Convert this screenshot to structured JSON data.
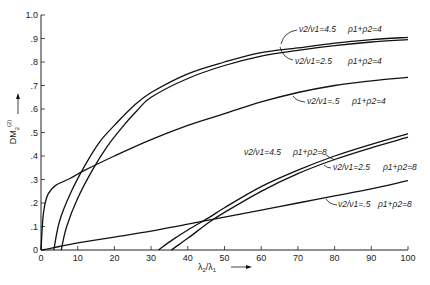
{
  "chart_data": {
    "type": "line",
    "title": "",
    "xlabel": "λ2/λ1 →",
    "ylabel": "DM2(2) →",
    "xlim": [
      0,
      100
    ],
    "ylim": [
      0,
      10
    ],
    "grid": false,
    "legend": "inline annotations",
    "x_ticks": [
      "0",
      "10",
      "20",
      "30",
      "40",
      "50",
      "60",
      "70",
      "80",
      "90",
      "100"
    ],
    "y_ticks": [
      "0",
      ".1",
      ".2",
      ".3",
      ".4",
      ".5",
      ".6",
      ".7",
      ".8",
      ".9",
      "1.0"
    ],
    "series": [
      {
        "name": "ν2/ν1=4.5, ρ1+ρ2=4",
        "x": [
          3.5,
          5,
          8,
          12,
          16,
          20,
          25,
          30,
          40,
          50,
          60,
          70,
          80,
          90,
          100
        ],
        "y": [
          0,
          1.2,
          2.4,
          3.6,
          4.6,
          5.3,
          6.1,
          6.7,
          7.5,
          8.0,
          8.4,
          8.6,
          8.8,
          8.95,
          9.05
        ]
      },
      {
        "name": "ν2/ν1=2.5, ρ1+ρ2=4",
        "x": [
          5.5,
          7,
          10,
          14,
          18,
          22,
          26,
          30,
          40,
          50,
          60,
          70,
          80,
          90,
          100
        ],
        "y": [
          0,
          1.0,
          2.2,
          3.4,
          4.4,
          5.2,
          5.9,
          6.5,
          7.3,
          7.85,
          8.25,
          8.5,
          8.7,
          8.85,
          8.95
        ]
      },
      {
        "name": "ν2/ν1=.5, ρ1+ρ2=4",
        "x": [
          0,
          0.5,
          1,
          2,
          4,
          8,
          12,
          20,
          30,
          40,
          50,
          60,
          70,
          80,
          90,
          100
        ],
        "y": [
          0,
          1.3,
          1.9,
          2.4,
          2.75,
          3.05,
          3.4,
          4.0,
          4.7,
          5.3,
          5.8,
          6.3,
          6.7,
          7.0,
          7.2,
          7.35
        ]
      },
      {
        "name": "ν2/ν1=4.5, ρ1+ρ2=8",
        "x": [
          32,
          36,
          40,
          46,
          50,
          60,
          70,
          80,
          90,
          100
        ],
        "y": [
          0,
          0.45,
          0.85,
          1.4,
          1.8,
          2.7,
          3.4,
          4.0,
          4.5,
          4.95
        ]
      },
      {
        "name": "ν2/ν1=2.5, ρ1+ρ2=8",
        "x": [
          35.5,
          40,
          46,
          50,
          60,
          70,
          80,
          90,
          100
        ],
        "y": [
          0,
          0.5,
          1.2,
          1.6,
          2.5,
          3.25,
          3.85,
          4.35,
          4.8
        ]
      },
      {
        "name": "ν2/ν1=.5, ρ1+ρ2=8",
        "x": [
          0,
          2,
          5,
          10,
          20,
          30,
          40,
          50,
          60,
          70,
          80,
          90,
          100
        ],
        "y": [
          0,
          0.05,
          0.15,
          0.3,
          0.55,
          0.8,
          1.1,
          1.4,
          1.7,
          2.0,
          2.3,
          2.6,
          2.95
        ]
      }
    ]
  },
  "axes": {
    "y_label_main": "DM",
    "y_label_sub": "2",
    "y_label_sup": "(2)",
    "x_label": "λ2/λ1",
    "x_label_main": "λ",
    "x_label_sub2": "2",
    "x_label_slash": "/λ",
    "x_label_sub1": "1"
  },
  "annotations": [
    {
      "ratio": "ν2/ν1=4.5",
      "rho": "ρ1+ρ2=4"
    },
    {
      "ratio": "ν2/ν1=2.5",
      "rho": "ρ1+ρ2=4"
    },
    {
      "ratio": "ν2/ν1=.5",
      "rho": "ρ1+ρ2=4"
    },
    {
      "ratio": "ν2/ν1=4.5",
      "rho": "ρ1+ρ2=8"
    },
    {
      "ratio": "ν2/ν1=2.5",
      "rho": "ρ1+ρ2=8"
    },
    {
      "ratio": "ν2/ν1=.5",
      "rho": "ρ1+ρ2=8"
    }
  ]
}
